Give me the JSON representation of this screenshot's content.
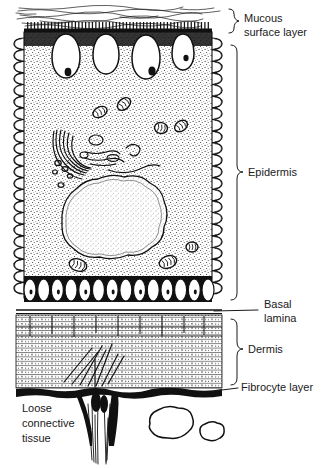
{
  "figure": {
    "style": "line-drawing",
    "ink_color": "#111111",
    "background_color": "#ffffff",
    "width": 335,
    "height": 468
  },
  "labels": [
    {
      "id": "mucous-surface-layer",
      "lines": [
        "Mucous",
        "surface layer"
      ],
      "line1": "Mucous",
      "line2": "surface layer",
      "x": 241,
      "y": 18,
      "connector": "brace",
      "brace_top": 9,
      "brace_bottom": 33,
      "brace_x": 229,
      "tick_y": 21
    },
    {
      "id": "epidermis",
      "lines": [
        "Epidermis"
      ],
      "line1": "Epidermis",
      "x": 245,
      "y": 172,
      "connector": "brace",
      "brace_top": 45,
      "brace_bottom": 300,
      "brace_x": 231,
      "tick_y": 172
    },
    {
      "id": "basal-lamina",
      "lines": [
        "Basal",
        "lamina"
      ],
      "line1": "Basal",
      "line2": "lamina",
      "x": 264,
      "y": 304,
      "connector": "leader",
      "leader_from_x": 214,
      "leader_from_y": 311,
      "leader_to_x": 258,
      "leader_to_y": 311
    },
    {
      "id": "dermis",
      "lines": [
        "Dermis"
      ],
      "line1": "Dermis",
      "x": 245,
      "y": 349,
      "connector": "brace",
      "brace_top": 319,
      "brace_bottom": 385,
      "brace_x": 231,
      "tick_y": 349
    },
    {
      "id": "fibrocyte-layer",
      "lines": [
        "Fibrocyte layer"
      ],
      "line1": "Fibrocyte layer",
      "x": 241,
      "y": 387,
      "connector": "leader",
      "leader_from_x": 214,
      "leader_from_y": 390,
      "leader_to_x": 238,
      "leader_to_y": 387
    },
    {
      "id": "loose-connective-tissue",
      "lines": [
        "Loose",
        "connective",
        "tissue"
      ],
      "line1": "Loose",
      "line2": "connective",
      "line3": "tissue",
      "x": 22,
      "y": 408,
      "connector": "none"
    }
  ],
  "structures": {
    "mucous_layer": {
      "name": "Mucous surface layer",
      "top": 8,
      "bottom": 26,
      "left": 16,
      "right": 222,
      "stroke_count": 34,
      "appearance": "wispy horizontal filaments"
    },
    "microvilli_band": {
      "name": "Microvilli / apical border",
      "y": 27,
      "height": 7,
      "tooth_count": 54,
      "appearance": "dark comb of short vertical teeth"
    },
    "epithelial_cell": {
      "name": "Mucous epithelial cell",
      "left": 22,
      "right": 214,
      "top": 30,
      "bottom": 300,
      "cytoplasm": "stippled"
    },
    "lateral_folds": {
      "name": "Interdigitating lateral membrane folds",
      "left_x": 22,
      "right_x": 214,
      "top": 30,
      "bottom": 300,
      "fold_count": 22,
      "appearance": "serpentine coiled membrane"
    },
    "mucous_vesicles": {
      "name": "Apical mucous (secretory) vesicles",
      "count": 4,
      "items": [
        {
          "cx": 66,
          "cy": 56,
          "rx": 14,
          "ry": 22,
          "inclusion": true,
          "inc_cx": 68,
          "inc_cy": 72,
          "inc_r": 3.4
        },
        {
          "cx": 106,
          "cy": 54,
          "rx": 13,
          "ry": 20,
          "inclusion": false
        },
        {
          "cx": 146,
          "cy": 57,
          "rx": 14,
          "ry": 22,
          "inclusion": true,
          "inc_cx": 152,
          "inc_cy": 71,
          "inc_r": 3.6
        },
        {
          "cx": 183,
          "cy": 52,
          "rx": 11,
          "ry": 18,
          "inclusion": true,
          "inc_cx": 186,
          "inc_cy": 58,
          "inc_r": 2.6
        }
      ]
    },
    "golgi": {
      "name": "Golgi apparatus",
      "cx": 68,
      "cy": 148,
      "stack_count": 6,
      "appearance": "curved flattened cisternae with vesicles"
    },
    "mitochondria": {
      "name": "Mitochondria",
      "count": 7,
      "items": [
        {
          "cx": 100,
          "cy": 112,
          "rx": 7.5,
          "ry": 5.0,
          "rot": -28
        },
        {
          "cx": 124,
          "cy": 104,
          "rx": 7.5,
          "ry": 5.2,
          "rot": -42
        },
        {
          "cx": 161,
          "cy": 128,
          "rx": 6.5,
          "ry": 5.5,
          "rot": 10
        },
        {
          "cx": 181,
          "cy": 126,
          "rx": 7.0,
          "ry": 5.0,
          "rot": -35
        },
        {
          "cx": 78,
          "cy": 265,
          "rx": 9.0,
          "ry": 6.0,
          "rot": 18
        },
        {
          "cx": 168,
          "cy": 262,
          "rx": 9.0,
          "ry": 6.0,
          "rot": -20
        },
        {
          "cx": 192,
          "cy": 247,
          "rx": 6.0,
          "ry": 5.0,
          "rot": 0
        }
      ]
    },
    "nucleus": {
      "name": "Nucleus",
      "cx": 116,
      "cy": 215,
      "rx": 54,
      "ry": 37,
      "lobes": 11,
      "appearance": "large lobed nucleus with double envelope"
    },
    "basal_vesicles": {
      "name": "Basal vesicle row",
      "y": 290,
      "count": 14,
      "left": 30,
      "right": 208,
      "rx": 6,
      "ry": 11
    },
    "basal_lamina": {
      "name": "Basal lamina",
      "y": 311,
      "left": 16,
      "right": 222,
      "thickness": 2
    },
    "dermis": {
      "name": "Dermis",
      "top": 314,
      "bottom": 388,
      "left": 16,
      "right": 222,
      "fiber_rows": 17,
      "appearance": "stratified collagen lamellae, dotted texture"
    },
    "fibrocyte_layer": {
      "name": "Fibrocyte layer",
      "y": 390,
      "left": 16,
      "right": 222,
      "appearance": "thick irregular black band"
    },
    "loose_connective_tissue": {
      "name": "Loose connective tissue",
      "top": 392,
      "bottom": 468,
      "fiber_bundle_x": 100,
      "cells": [
        {
          "cx": 168,
          "cy": 425,
          "rx": 20,
          "ry": 15
        },
        {
          "cx": 209,
          "cy": 433,
          "rx": 10,
          "ry": 8
        }
      ]
    }
  }
}
